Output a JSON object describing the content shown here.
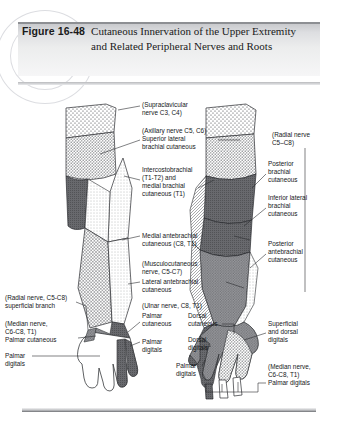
{
  "figure": {
    "label": "Figure 16-48",
    "title": "Cutaneous Innervation of the Upper Extremity and Related Peripheral Nerves and Roots"
  },
  "illustration": {
    "type": "anatomical-diagram",
    "views": [
      {
        "name": "anterior-view",
        "side": "left",
        "description": "Anterior (palmar) aspect of upper extremity"
      },
      {
        "name": "posterior-view",
        "side": "right",
        "description": "Posterior (dorsal) aspect of upper extremity"
      }
    ],
    "labels": {
      "supraclavicular": [
        "(Supraclavicular",
        "nerve C3, C4)"
      ],
      "axillary": [
        "(Axillary nerve C5, C6)",
        "Superior lateral",
        "brachial cutaneous"
      ],
      "intercostobrachial": [
        "Intercostobrachial",
        "(T1-T2) and",
        "medial brachial",
        "cutaneous (T1)"
      ],
      "medial_antebrachial": [
        "Medial antebrachial",
        "cutaneous (C8, T1)"
      ],
      "musculocutaneous": [
        "(Musculocutaneous",
        "nerve, C5-C7)",
        "Lateral antebrachial",
        "cutaneous"
      ],
      "ulnar": [
        "(Ulnar nerve, C8, T1)"
      ],
      "palmar_cutaneous_ulnar": [
        "Palmar",
        "cutaneous"
      ],
      "dorsal_cutaneous_ulnar": [
        "Dorsal",
        "cutaneous"
      ],
      "palmar_digitals_left": [
        "Palmar",
        "digitals"
      ],
      "radial_superficial": [
        "(Radial nerve, C5-C8)",
        "superficial branch"
      ],
      "median_left": [
        "(Median nerve,",
        "C6-C8, T1)",
        "Palmar cutaneous"
      ],
      "palmar_digitals_median_left": [
        "Palmar",
        "digitals"
      ],
      "radial_right": [
        "(Radial nerve",
        "C5–C8)"
      ],
      "posterior_brachial": [
        "Posterior",
        "brachial",
        "cutaneous"
      ],
      "inferior_lateral_brachial": [
        "Inferior lateral",
        "brachial",
        "cutaneous"
      ],
      "posterior_antebrachial": [
        "Posterior",
        "antebrachial",
        "cutaneous"
      ],
      "superficial_dorsal_digitals": [
        "Superficial",
        "and dorsal",
        "digitals"
      ],
      "dorsal_digitals_right": [
        "Dorsal",
        "digitals"
      ],
      "palmar_digitals_right": [
        "Palmar",
        "digitals"
      ],
      "median_right": [
        "(Median nerve,",
        "C6-C8, T1)",
        "Palmar digitals"
      ]
    }
  }
}
